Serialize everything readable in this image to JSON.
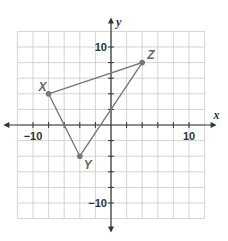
{
  "chart_data": {
    "type": "scatter",
    "title": "",
    "xlabel": "x",
    "ylabel": "y",
    "xlim": [
      -12,
      12
    ],
    "ylim": [
      -12,
      12
    ],
    "grid": true,
    "grid_step": 2,
    "x_tick_labels": [
      {
        "value": -10,
        "label": "−10"
      },
      {
        "value": 10,
        "label": "10"
      }
    ],
    "y_tick_labels": [
      {
        "value": 10,
        "label": "10"
      },
      {
        "value": -10,
        "label": "−10"
      }
    ],
    "points": [
      {
        "name": "X",
        "x": -8,
        "y": 4
      },
      {
        "name": "Y",
        "x": -4,
        "y": -4
      },
      {
        "name": "Z",
        "x": 4,
        "y": 8
      }
    ],
    "polygon": [
      "X",
      "Y",
      "Z"
    ],
    "colors": {
      "shape": "#777777",
      "grid": "#c9c9c9",
      "axis": "#333333"
    }
  }
}
